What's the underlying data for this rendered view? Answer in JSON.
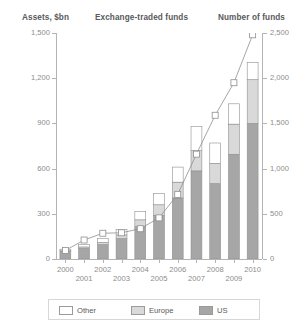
{
  "header": {
    "left_axis_title": "Assets, $bn",
    "center_title": "Exchange-traded funds",
    "right_axis_title": "Number of funds"
  },
  "legend": {
    "items": [
      {
        "label": "Other",
        "color": "#ffffff"
      },
      {
        "label": "Europe",
        "color": "#d9d9d9"
      },
      {
        "label": "US",
        "color": "#a6a6a6"
      }
    ]
  },
  "chart_data": {
    "type": "bar",
    "title": "Exchange-traded funds",
    "xlabel": "",
    "ylabel": "Assets, $bn",
    "y2label": "Number of funds",
    "ylim": [
      0,
      1500
    ],
    "y2lim": [
      0,
      2500
    ],
    "yticks": [
      "0",
      "300",
      "600",
      "900",
      "1,200",
      "1,500"
    ],
    "ytick_values": [
      0,
      300,
      600,
      900,
      1200,
      1500
    ],
    "y2ticks": [
      "0",
      "500",
      "1,000",
      "1,500",
      "2,000",
      "2,500"
    ],
    "y2tick_values": [
      0,
      500,
      1000,
      1500,
      2000,
      2500
    ],
    "grid": false,
    "legend_position": "bottom",
    "categories": [
      "2000",
      "2001",
      "2002",
      "2003",
      "2004",
      "2005",
      "2006",
      "2007",
      "2008",
      "2009",
      "2010"
    ],
    "series": [
      {
        "name": "US",
        "color": "#a6a6a6",
        "values": [
          50,
          70,
          95,
          135,
          215,
          290,
          405,
          585,
          500,
          695,
          900
        ]
      },
      {
        "name": "Europe",
        "color": "#d9d9d9",
        "values": [
          5,
          10,
          15,
          25,
          45,
          70,
          105,
          135,
          135,
          200,
          290
        ]
      },
      {
        "name": "Other",
        "color": "#ffffff",
        "values": [
          10,
          15,
          25,
          35,
          55,
          75,
          100,
          160,
          135,
          135,
          115
        ]
      }
    ],
    "line_series": {
      "name": "Number of funds",
      "axis": "right",
      "marker": "square",
      "values": [
        95,
        210,
        285,
        290,
        335,
        455,
        715,
        1160,
        1590,
        1950,
        2480
      ]
    }
  }
}
